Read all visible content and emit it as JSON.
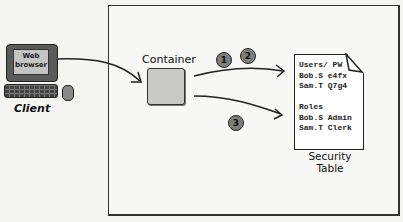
{
  "diagram": {
    "client": {
      "screen_label_line1": "Web",
      "screen_label_line2": "browser",
      "label": "Client"
    },
    "container": {
      "label": "Container"
    },
    "steps": [
      {
        "number": "1"
      },
      {
        "number": "2"
      },
      {
        "number": "3"
      }
    ],
    "security_table": {
      "lines": [
        "Users/ PW",
        "Bob.S e4fx",
        "Sam.T Q7g4",
        "",
        "Roles",
        "Bob.S Admin",
        "Sam.T Clerk"
      ],
      "label_line1": "Security",
      "label_line2": "Table"
    },
    "colors": {
      "background": "#f4f4f2",
      "stroke": "#222222",
      "container_fill": "#c9c9c7",
      "step_fill": "#7d7d7b",
      "monitor_fill": "#5a5a5a"
    }
  }
}
